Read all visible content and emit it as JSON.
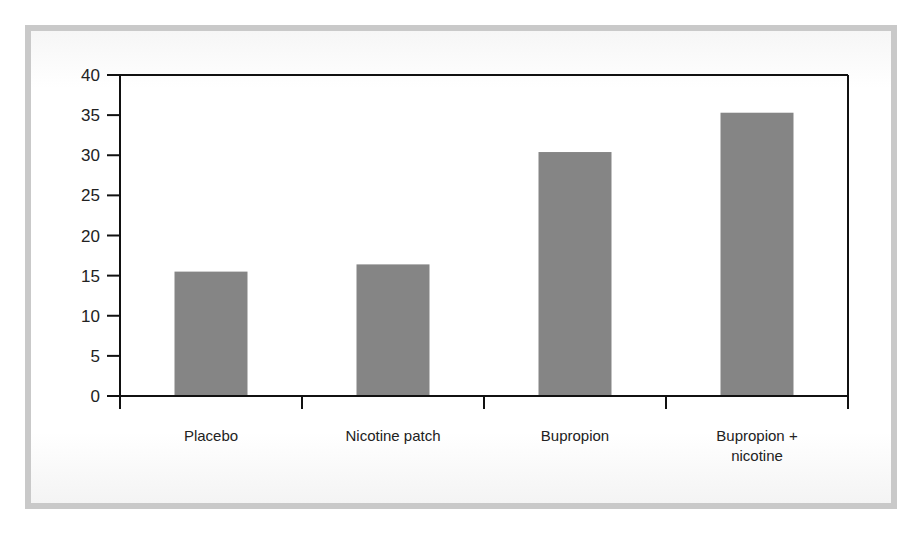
{
  "chart_data": {
    "type": "bar",
    "title": "",
    "xlabel": "",
    "ylabel": "",
    "categories": [
      "Placebo",
      "Nicotine patch",
      "Bupropion",
      "Bupropion + nicotine"
    ],
    "category_lines": [
      [
        "Placebo"
      ],
      [
        "Nicotine patch"
      ],
      [
        "Bupropion"
      ],
      [
        "Bupropion +",
        "nicotine"
      ]
    ],
    "values": [
      15.5,
      16.4,
      30.4,
      35.3
    ],
    "ylim": [
      0,
      40
    ],
    "yticks": [
      0,
      5,
      10,
      15,
      20,
      25,
      30,
      35,
      40
    ],
    "grid": false,
    "legend": null,
    "bar_color": "#858585"
  }
}
